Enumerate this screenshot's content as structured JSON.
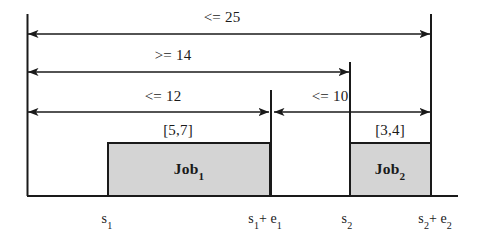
{
  "diagram": {
    "colors": {
      "stroke": "#1a1a1a",
      "job_fill": "#d4d4d4",
      "background": "#ffffff"
    },
    "constraints": [
      {
        "id": "total-span",
        "text": "<= 25",
        "from": "s_1",
        "to": "s_2 + e_2",
        "label_x": 222,
        "line_y": 34,
        "x1": 28,
        "x2": 430,
        "arrow_left": true,
        "arrow_right": true
      },
      {
        "id": "start-to-start",
        "text": ">= 14",
        "from": "s_1",
        "to": "s_2",
        "label_x": 173,
        "line_y": 72,
        "x1": 28,
        "x2": 349,
        "arrow_left": true,
        "arrow_right": true
      },
      {
        "id": "job1-window",
        "text": "<= 12",
        "from": "s_1",
        "to": "s_1 + e_1",
        "label_x": 163,
        "line_y": 112,
        "x1": 28,
        "x2": 269,
        "arrow_left": true,
        "arrow_right": true
      },
      {
        "id": "gap-window",
        "text": "<= 10",
        "from": "s_1 + e_1",
        "to": "s_2 + e_2",
        "label_x": 330,
        "line_y": 112,
        "x1": 274,
        "x2": 430,
        "arrow_left": true,
        "arrow_right": true
      }
    ],
    "jobs": [
      {
        "id": "job1",
        "name": "Job",
        "index": "1",
        "duration_label": "[5,7]",
        "start_tick": "s",
        "start_tick_index": "1",
        "end_tick_prefix": "s",
        "end_tick_prefix_index": "1",
        "end_tick_suffix": "+ e",
        "end_tick_suffix_index": "1",
        "x": 108,
        "width": 162,
        "top": 143,
        "height": 53,
        "label_cx": 189,
        "duration_cx": 178,
        "start_label_x": 107,
        "end_label_x": 265
      },
      {
        "id": "job2",
        "name": "Job",
        "index": "2",
        "duration_label": "[3,4]",
        "start_tick": "s",
        "start_tick_index": "2",
        "end_tick_prefix": "s",
        "end_tick_prefix_index": "2",
        "end_tick_suffix": "+ e",
        "end_tick_suffix_index": "2",
        "x": 350,
        "width": 81,
        "top": 143,
        "height": 53,
        "label_cx": 390,
        "duration_cx": 390,
        "start_label_x": 347,
        "end_label_x": 435
      }
    ],
    "axis": {
      "baseline_y": 196,
      "baseline_x1": 27,
      "baseline_x2": 458,
      "verticals": [
        {
          "id": "vline-s1",
          "x": 27,
          "y1": 14,
          "y2": 196
        },
        {
          "id": "vline-s1-plus-e1",
          "x": 271,
          "y1": 90,
          "y2": 196
        },
        {
          "id": "vline-s2",
          "x": 350,
          "y1": 62,
          "y2": 196
        },
        {
          "id": "vline-s2-plus-e2",
          "x": 431,
          "y1": 14,
          "y2": 196
        }
      ]
    }
  }
}
